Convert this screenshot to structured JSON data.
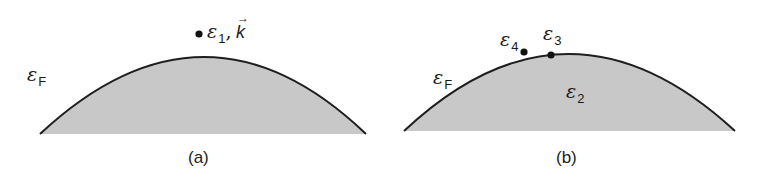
{
  "panels": [
    {
      "id": "a",
      "caption": "(a)",
      "fermi_label": {
        "symbol": "ε",
        "sub": "F"
      },
      "point_label": {
        "symbol": "ε",
        "sub": "1",
        "separator": ",",
        "vector": "k",
        "vector_arrow": "→"
      }
    },
    {
      "id": "b",
      "caption": "(b)",
      "fermi_label": {
        "symbol": "ε",
        "sub": "F"
      },
      "inside_label": {
        "symbol": "ε",
        "sub": "2"
      },
      "point3_label": {
        "symbol": "ε",
        "sub": "3"
      },
      "point4_label": {
        "symbol": "ε",
        "sub": "4"
      }
    }
  ],
  "colors": {
    "fill": "#c8c8c8",
    "outline": "#1e1e1e",
    "dot": "#111111"
  }
}
